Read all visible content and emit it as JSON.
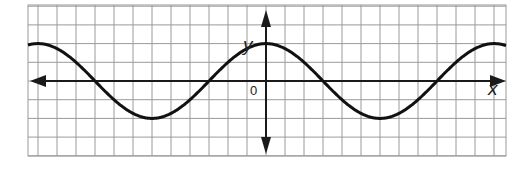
{
  "chart_data": {
    "type": "line",
    "title": "",
    "xlabel": "x",
    "ylabel": "y",
    "origin_label": "0",
    "grid": true,
    "function": "y = 2cos(πx/6)",
    "xlim": [
      -12.5,
      12.7
    ],
    "ylim": [
      -4,
      4
    ],
    "series": [
      {
        "name": "curve",
        "x": [
          -12,
          -9,
          -6,
          -3,
          0,
          3,
          6,
          9,
          12
        ],
        "y": [
          2,
          0,
          -2,
          0,
          2,
          0,
          -2,
          0,
          2
        ]
      }
    ],
    "colors": {
      "grid": "#9a9a9a",
      "axes": "#1a1a1a",
      "curve": "#111111"
    }
  }
}
